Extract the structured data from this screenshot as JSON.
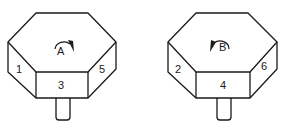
{
  "figure": {
    "colors": {
      "line": "#1a1a1a",
      "background": "#ffffff"
    },
    "prisms": [
      {
        "id": "A",
        "rotation_label": "A",
        "rotation_direction": "clockwise",
        "faces": {
          "left": "1",
          "front": "3",
          "right": "5"
        }
      },
      {
        "id": "B",
        "rotation_label": "B",
        "rotation_direction": "counterclockwise",
        "faces": {
          "left": "2",
          "front": "4",
          "right": "6"
        }
      }
    ]
  }
}
